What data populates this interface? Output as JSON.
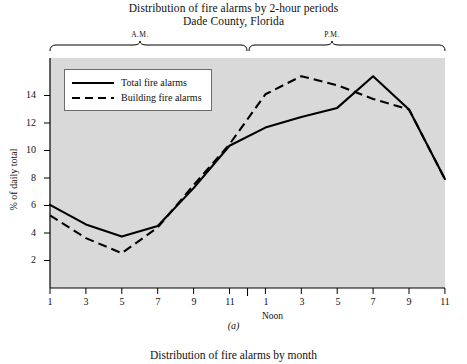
{
  "figure": {
    "title_line1": "Distribution of fire alarms by 2-hour periods",
    "title_line2": "Dade County, Florida",
    "caption": "(a)",
    "next_figure_title": "Distribution of fire alarms by month",
    "period_braces": [
      {
        "label": "A.M."
      },
      {
        "label": "P.M."
      }
    ],
    "noon_marker": "Noon",
    "plot_background": "#d9d9d9",
    "line_color": "#000000"
  },
  "legend": {
    "entries": [
      {
        "label": "Total fire alarms",
        "style": "solid"
      },
      {
        "label": "Building fire alarms",
        "style": "dashed"
      }
    ]
  },
  "chart_data": {
    "type": "line",
    "xlabel": "",
    "ylabel": "% of daily total",
    "ylim": [
      0,
      15.2
    ],
    "yticks": [
      2,
      4,
      6,
      8,
      10,
      12,
      14
    ],
    "ytick_labels": [
      "2",
      "4",
      "6",
      "8",
      "10",
      "12",
      "14"
    ],
    "grid": false,
    "legend_position": "upper-left-inside",
    "x": [
      1,
      3,
      5,
      7,
      9,
      11,
      13,
      15,
      17,
      19,
      21,
      23
    ],
    "xtick_labels": [
      "1",
      "3",
      "5",
      "7",
      "9",
      "11",
      "1",
      "3",
      "5",
      "7",
      "9",
      "11"
    ],
    "x_period_labels": [
      "A.M.",
      "A.M.",
      "A.M.",
      "A.M.",
      "A.M.",
      "A.M.",
      "P.M.",
      "P.M.",
      "P.M.",
      "P.M.",
      "P.M.",
      "P.M."
    ],
    "annotations": [
      {
        "text": "Noon",
        "x": 12
      },
      {
        "text": "A.M.",
        "x_span": [
          1,
          12
        ]
      },
      {
        "text": "P.M.",
        "x_span": [
          12,
          23
        ]
      }
    ],
    "series": [
      {
        "name": "Total fire alarms",
        "style": "solid",
        "values": [
          5.5,
          4.2,
          3.4,
          4.1,
          6.6,
          9.4,
          10.6,
          11.3,
          11.9,
          14.0,
          11.8,
          7.2
        ]
      },
      {
        "name": "Building fire alarms",
        "style": "dashed",
        "values": [
          4.8,
          3.3,
          2.3,
          4.0,
          6.8,
          9.5,
          12.8,
          14.0,
          13.4,
          12.5,
          11.8,
          7.2
        ]
      }
    ]
  }
}
